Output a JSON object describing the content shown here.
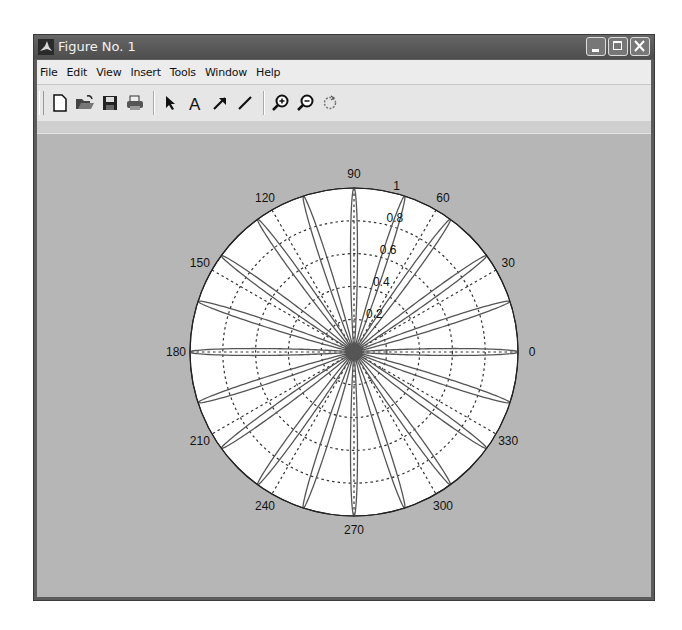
{
  "window": {
    "title": "Figure No. 1",
    "controls": [
      "minimize",
      "maximize",
      "close"
    ]
  },
  "menubar": {
    "items": [
      {
        "label": "File"
      },
      {
        "label": "Edit"
      },
      {
        "label": "View"
      },
      {
        "label": "Insert"
      },
      {
        "label": "Tools"
      },
      {
        "label": "Window"
      },
      {
        "label": "Help"
      }
    ]
  },
  "toolbar": {
    "buttons": [
      {
        "name": "new-figure",
        "icon": "new-file-icon"
      },
      {
        "name": "open-file",
        "icon": "open-folder-icon"
      },
      {
        "name": "save-figure",
        "icon": "save-disk-icon"
      },
      {
        "name": "print-figure",
        "icon": "printer-icon"
      },
      {
        "name": "edit-plot",
        "icon": "arrow-pointer-icon"
      },
      {
        "name": "insert-text",
        "icon": "text-a-icon"
      },
      {
        "name": "insert-arrow",
        "icon": "arrow-icon"
      },
      {
        "name": "insert-line",
        "icon": "line-icon"
      },
      {
        "name": "zoom-in",
        "icon": "zoom-in-icon"
      },
      {
        "name": "zoom-out",
        "icon": "zoom-out-icon"
      },
      {
        "name": "rotate-3d",
        "icon": "rotate-icon"
      }
    ]
  },
  "colors": {
    "figure_bg": "#b6b6b6",
    "axes_bg": "#ffffff",
    "line": "#555555",
    "titlebar": "#5c5c5c"
  },
  "chart_data": {
    "type": "polar",
    "title": "",
    "n_petals": 20,
    "petal_angles_deg": [
      0,
      18,
      36,
      54,
      72,
      90,
      108,
      126,
      144,
      162,
      180,
      198,
      216,
      234,
      252,
      270,
      288,
      306,
      324,
      342
    ],
    "r_max": 1,
    "angle_ticks": [
      "0",
      "30",
      "60",
      "90",
      "120",
      "150",
      "180",
      "210",
      "240",
      "270",
      "300",
      "330"
    ],
    "radial_ticks": [
      "0.2",
      "0.4",
      "0.6",
      "0.8",
      "1"
    ],
    "grid": true,
    "grid_style": "dotted"
  }
}
